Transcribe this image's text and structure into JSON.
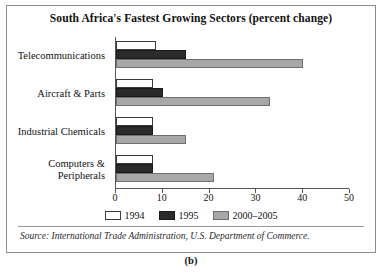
{
  "figure": {
    "panel_letter": "(b)",
    "source_note": "Source: International Trade Administration, U.S. Department of Commerce."
  },
  "chart_data": {
    "type": "bar",
    "orientation": "horizontal",
    "title": "South Africa's Fastest Growing Sectors (percent change)",
    "xlabel": "",
    "ylabel": "",
    "xlim": [
      0,
      50
    ],
    "xticks": [
      0,
      10,
      20,
      30,
      40,
      50
    ],
    "xtick_labels": [
      "0",
      "10",
      "20",
      "30",
      "40",
      "50"
    ],
    "grid": false,
    "legend_position": "bottom-center",
    "categories": [
      "Telecommunications",
      "Aircraft & Parts",
      "Industrial Chemicals",
      "Computers & Peripherals"
    ],
    "category_lines": [
      [
        "Telecommunications"
      ],
      [
        "Aircraft & Parts"
      ],
      [
        "Industrial Chemicals"
      ],
      [
        "Computers &",
        "Peripherals"
      ]
    ],
    "series": [
      {
        "name": "1994",
        "color": "#ffffff",
        "values": [
          8.5,
          8,
          8,
          8
        ]
      },
      {
        "name": "1995",
        "color": "#2b2b2b",
        "values": [
          15,
          10,
          8,
          8
        ]
      },
      {
        "name": "2000–2005",
        "color": "#a8a8a8",
        "values": [
          40,
          33,
          15,
          21
        ]
      }
    ]
  }
}
